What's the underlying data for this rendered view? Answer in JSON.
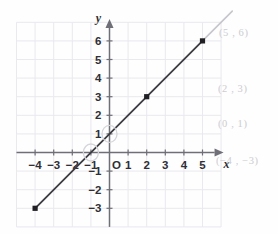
{
  "chart_data": {
    "type": "line",
    "title": "",
    "xlabel": "x",
    "ylabel": "y",
    "xlim": [
      -5,
      6
    ],
    "ylim": [
      -4,
      7
    ],
    "grid": true,
    "grid_color": "#e9e9ee",
    "axis_color": "#6f6f77",
    "line_color": "#3c3c42",
    "line_extension_color": "#c6c6cc",
    "point_color": "#202024",
    "equation_slope": 1,
    "equation_intercept": 1,
    "x_ticks": [
      -4,
      -3,
      -2,
      -1,
      1,
      2,
      3,
      4,
      5
    ],
    "x_tick_labels": [
      "−4",
      "−3",
      "−2",
      "−1",
      "1",
      "2",
      "3",
      "4",
      "5"
    ],
    "y_ticks": [
      -3,
      -2,
      -1,
      1,
      2,
      3,
      4,
      5,
      6
    ],
    "y_tick_labels": [
      "−3",
      "−2",
      "−1",
      "1",
      "2",
      "3",
      "4",
      "5",
      "6"
    ],
    "origin_label": "O",
    "points": [
      {
        "x": -4,
        "y": -3,
        "marker": "filled-square"
      },
      {
        "x": 2,
        "y": 3,
        "marker": "filled-square"
      },
      {
        "x": 5,
        "y": 6,
        "marker": "filled-square"
      }
    ],
    "circled_points": [
      {
        "x": 0,
        "y": 1
      },
      {
        "x": -1,
        "y": 0
      }
    ],
    "line_segment": {
      "x_start": -4,
      "y_start": -3,
      "x_end": 5,
      "y_end": 6
    },
    "line_extension": {
      "x_start": 5,
      "y_start": 6,
      "x_end": 6.6,
      "y_end": 7.6
    }
  },
  "annotations": {
    "point_5_6": "(5 , 6)",
    "point_2_3": "(2 , 3)",
    "point_0_1": "(0 , 1)",
    "point_neg4_neg3": "(−4 , −3)"
  }
}
